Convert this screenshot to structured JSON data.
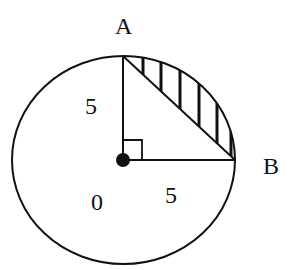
{
  "diagram": {
    "type": "geometry",
    "labels": {
      "point_a": "A",
      "point_b": "B",
      "center": "0",
      "radius_oa": "5",
      "radius_ob": "5"
    },
    "colors": {
      "stroke": "#111111",
      "background": "#ffffff"
    }
  }
}
